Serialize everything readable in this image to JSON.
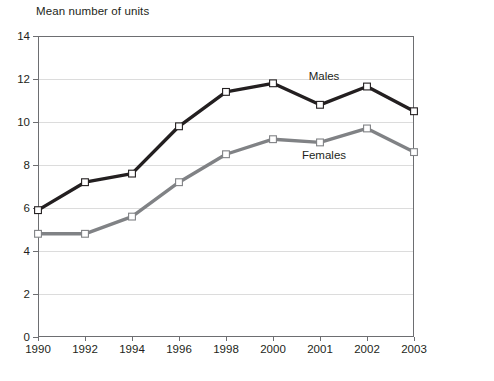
{
  "chart_data": {
    "type": "line",
    "title": "Mean number of units",
    "xlabel": "",
    "ylabel": "Mean number of units",
    "categories": [
      "1990",
      "1992",
      "1994",
      "1996",
      "1998",
      "2000",
      "2001",
      "2002",
      "2003"
    ],
    "series": [
      {
        "name": "Males",
        "color": "#231f20",
        "values": [
          5.9,
          7.2,
          7.6,
          9.8,
          11.4,
          11.8,
          10.8,
          11.65,
          10.5
        ]
      },
      {
        "name": "Females",
        "color": "#808285",
        "values": [
          4.8,
          4.8,
          5.6,
          7.2,
          8.5,
          9.2,
          9.05,
          9.7,
          8.6
        ]
      }
    ],
    "ylim": [
      0,
      14
    ],
    "yticks": [
      0,
      2,
      4,
      6,
      8,
      10,
      12,
      14
    ],
    "ytick_labels": [
      "0",
      "2",
      "4",
      "6",
      "8",
      "10",
      "12",
      "14"
    ],
    "grid": true,
    "legend_position": "inline-annotations",
    "annotations": [
      {
        "text": "Males",
        "series": "Males"
      },
      {
        "text": "Females",
        "series": "Females"
      }
    ],
    "marker": "open-square"
  }
}
